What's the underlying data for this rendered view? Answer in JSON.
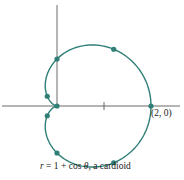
{
  "figure": {
    "title": "r = 1 + cos θ, a cardioid",
    "caption": {
      "var": "r",
      "eq": " = 1 + cos ",
      "theta": "θ",
      "rest": ", a cardioid"
    },
    "point_label": "(2, 0)",
    "colors": {
      "curve": "#2f7f76",
      "axes": "#444444",
      "text": "#222222"
    }
  },
  "chart_data": {
    "type": "line",
    "title": "r = 1 + cos θ, a cardioid",
    "equation": "r = 1 + cos(theta)",
    "coordinate_system": "polar",
    "xlabel": "",
    "ylabel": "",
    "axis_ticks": {
      "x": [
        1
      ]
    },
    "annotations": [
      {
        "text": "(2, 0)",
        "x": 2,
        "y": 0
      }
    ],
    "marked_points": [
      {
        "theta": "0",
        "x": 2.0,
        "y": 0.0
      },
      {
        "theta": "π/4",
        "x": 1.207,
        "y": 1.207
      },
      {
        "theta": "π/2",
        "x": 0.0,
        "y": 1.0
      },
      {
        "theta": "3π/4",
        "x": -0.207,
        "y": 0.207
      },
      {
        "theta": "π",
        "x": 0.0,
        "y": 0.0
      },
      {
        "theta": "5π/4",
        "x": -0.207,
        "y": -0.207
      },
      {
        "theta": "3π/2",
        "x": 0.0,
        "y": -1.0
      },
      {
        "theta": "7π/4",
        "x": 1.207,
        "y": -1.207
      }
    ],
    "grid": false,
    "xlim": [
      -1.2,
      2.6
    ],
    "ylim": [
      -1.6,
      2.1
    ]
  }
}
